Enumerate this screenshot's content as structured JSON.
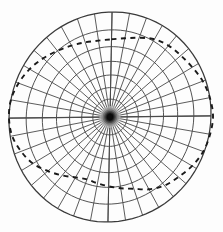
{
  "figure": {
    "title": "",
    "kind": "polar-grid-with-dashed-contour",
    "background_color": "#fdfdfd",
    "grid_color": "#4a4a4a",
    "outer_ring_color": "#3a3a3a",
    "dashed_curve_color": "#1a1a1a",
    "core_color": "#0b0b0b"
  },
  "chart_data": {
    "type": "scatter",
    "title": "",
    "subtitle": "",
    "xlabel": "",
    "ylabel": "",
    "grid": true,
    "legend_position": "none",
    "annotations": [],
    "tick_labels": [],
    "polar_grid": {
      "center_x": 110,
      "center_y": 117,
      "radius_x": 101,
      "radius_y": 105,
      "skew_deg": -4,
      "spoke_count": 36,
      "spoke_step_deg": 10,
      "ring_count": 8,
      "ring_radii_fraction": [
        0.07,
        0.17,
        0.28,
        0.4,
        0.53,
        0.67,
        0.83,
        1.0
      ],
      "axis_lines_deg": [
        0,
        90
      ]
    },
    "dashed_contour": {
      "closed": true,
      "dash_pattern": [
        5,
        4.5
      ],
      "points_polar_deg_frac": [
        [
          90,
          0.74
        ],
        [
          80,
          0.76
        ],
        [
          70,
          0.8
        ],
        [
          60,
          0.85
        ],
        [
          50,
          0.88
        ],
        [
          40,
          0.9
        ],
        [
          30,
          0.93
        ],
        [
          20,
          0.97
        ],
        [
          10,
          1.0
        ],
        [
          0,
          1.02
        ],
        [
          350,
          1.01
        ],
        [
          340,
          0.99
        ],
        [
          330,
          0.95
        ],
        [
          320,
          0.9
        ],
        [
          310,
          0.86
        ],
        [
          300,
          0.8
        ],
        [
          290,
          0.73
        ],
        [
          280,
          0.69
        ],
        [
          270,
          0.66
        ],
        [
          260,
          0.64
        ],
        [
          250,
          0.63
        ],
        [
          240,
          0.66
        ],
        [
          230,
          0.72
        ],
        [
          220,
          0.79
        ],
        [
          210,
          0.87
        ],
        [
          200,
          0.93
        ],
        [
          190,
          0.98
        ],
        [
          180,
          1.0
        ],
        [
          170,
          1.0
        ],
        [
          160,
          0.97
        ],
        [
          150,
          0.93
        ],
        [
          140,
          0.88
        ],
        [
          130,
          0.83
        ],
        [
          120,
          0.79
        ],
        [
          110,
          0.76
        ],
        [
          100,
          0.74
        ]
      ]
    }
  }
}
